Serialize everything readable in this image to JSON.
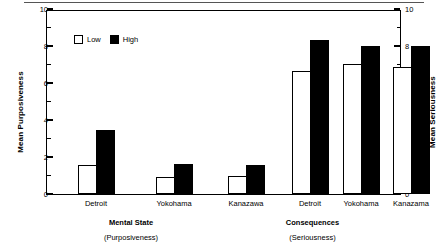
{
  "chart_data": {
    "type": "bar",
    "title": "",
    "subtitle": "",
    "ylabel": "Mean Purposiveness",
    "ylabel_right": "Mean Seriousness",
    "xlabel": "",
    "ylim": [
      0,
      10
    ],
    "ylim_right": [
      0,
      10
    ],
    "yticks": [
      0,
      2,
      4,
      6,
      8,
      10
    ],
    "ytick_labels": [
      "0",
      "2",
      "4",
      "6",
      "8",
      "10"
    ],
    "yticks_right": [
      0,
      2,
      4,
      6,
      8,
      10
    ],
    "ytick_labels_right": [
      "0",
      "2",
      "4",
      "6",
      "8",
      "10"
    ],
    "minor_tick_interval": 1,
    "grid": false,
    "legend": {
      "position": "upper-left-inside",
      "entries": [
        {
          "name": "Low",
          "color": "#ffffff",
          "edge": "#000000"
        },
        {
          "name": "High",
          "color": "#000000",
          "edge": "#000000"
        }
      ]
    },
    "categories": [
      "Detroit",
      "Yokohama",
      "Kanazawa",
      "Detroit",
      "Yokohama",
      "Kanazama"
    ],
    "series": [
      {
        "name": "Low",
        "values": [
          1.55,
          0.9,
          1.0,
          6.65,
          7.05,
          6.85
        ]
      },
      {
        "name": "High",
        "values": [
          3.45,
          1.6,
          1.55,
          8.3,
          8.0,
          8.0
        ]
      }
    ],
    "groups": [
      {
        "main": "Mental State",
        "sub": "(Purposiveness)",
        "axis": "left",
        "categories": [
          "Detroit",
          "Yokohama",
          "Kanazawa"
        ],
        "low": [
          1.55,
          0.9,
          1.0
        ],
        "high": [
          3.45,
          1.6,
          1.55
        ]
      },
      {
        "main": "Consequences",
        "sub": "(Seriousness)",
        "axis": "right",
        "categories": [
          "Detroit",
          "Yokohama",
          "Kanazama"
        ],
        "low": [
          6.65,
          7.05,
          6.85
        ],
        "high": [
          8.3,
          8.0,
          8.0
        ]
      }
    ],
    "colors": {
      "low_fill": "#ffffff",
      "high_fill": "#000000",
      "edge": "#000000",
      "background": "#ffffff",
      "rule": "#555555"
    }
  }
}
